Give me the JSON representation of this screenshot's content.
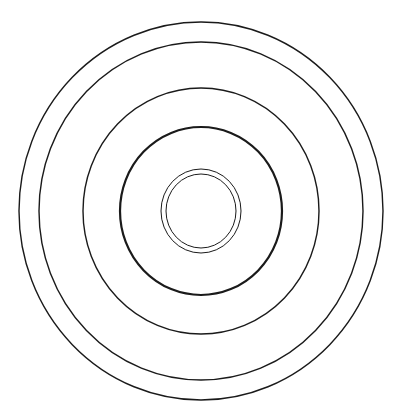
{
  "figure": {
    "type": "concentric-rings",
    "background": "#ffffff",
    "stroke_color": "#1a1a1a",
    "center": {
      "x": 201,
      "y": 211
    },
    "rings": [
      {
        "name": "ring-outer",
        "rx": 182,
        "ry": 189,
        "stroke_width": 1.4
      },
      {
        "name": "ring-second",
        "rx": 162,
        "ry": 169,
        "stroke_width": 1.4
      },
      {
        "name": "ring-third",
        "rx": 118,
        "ry": 123,
        "stroke_width": 1.4
      },
      {
        "name": "ring-fourth-thick",
        "rx": 81,
        "ry": 84,
        "stroke_width": 2.2
      },
      {
        "name": "ring-inner-outer",
        "rx": 40,
        "ry": 42,
        "stroke_width": 1.0
      },
      {
        "name": "ring-inner-inner",
        "rx": 35,
        "ry": 37,
        "stroke_width": 1.0
      }
    ]
  }
}
